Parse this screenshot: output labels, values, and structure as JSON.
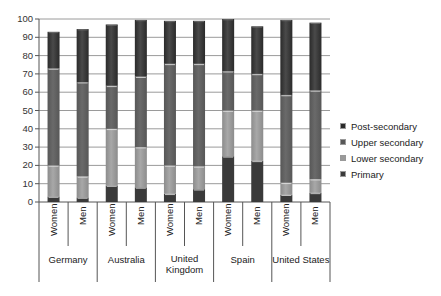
{
  "chart_data": {
    "type": "bar",
    "stacked": true,
    "title": "",
    "xlabel": "",
    "ylabel": "",
    "ylim": [
      0,
      100
    ],
    "yticks": [
      0,
      10,
      20,
      30,
      40,
      50,
      60,
      70,
      80,
      90,
      100
    ],
    "grid": true,
    "legend_position": "right",
    "groups": [
      "Germany",
      "Australia",
      "United Kingdom",
      "Spain",
      "United States"
    ],
    "group_labels": [
      [
        "Germany"
      ],
      [
        "Australia"
      ],
      [
        "United",
        "Kingdom"
      ],
      [
        "Spain"
      ],
      [
        "United States"
      ]
    ],
    "subcategories": [
      "Women",
      "Men"
    ],
    "categories": [
      "Germany Women",
      "Germany Men",
      "Australia Women",
      "Australia Men",
      "United Kingdom Women",
      "United Kingdom Men",
      "Spain Women",
      "Spain Men",
      "United States Women",
      "United States Men"
    ],
    "series": [
      {
        "name": "Primary",
        "color": "#3a3a3a",
        "values": [
          3,
          2.5,
          9,
          8,
          4.5,
          7,
          25,
          22.5,
          4,
          5
        ]
      },
      {
        "name": "Lower secondary",
        "color": "#8c8c8c",
        "values": [
          17,
          11.5,
          31,
          22,
          15.5,
          12.5,
          25,
          27.5,
          6.5,
          7.5
        ]
      },
      {
        "name": "Upper secondary",
        "color": "#575757",
        "values": [
          53,
          51.5,
          23.5,
          38.5,
          55.5,
          56,
          21.5,
          20,
          48,
          48.5
        ]
      },
      {
        "name": "Post-secondary",
        "color": "#2a2a2a",
        "values": [
          20,
          29,
          33.5,
          31,
          23.5,
          23.5,
          28.5,
          26,
          41,
          37
        ]
      }
    ],
    "totals": [
      93,
      94.5,
      97,
      99.5,
      99,
      99,
      100,
      96,
      99.5,
      98
    ]
  },
  "legend": {
    "items": [
      {
        "label": "Post-secondary",
        "color": "#2a2a2a"
      },
      {
        "label": "Upper secondary",
        "color": "#575757"
      },
      {
        "label": "Lower secondary",
        "color": "#9a9a9a"
      },
      {
        "label": "Primary",
        "color": "#3a3a3a"
      }
    ]
  }
}
